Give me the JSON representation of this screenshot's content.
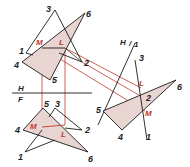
{
  "diagram": {
    "type": "descriptive-geometry-intersection",
    "colors": {
      "line": "#1a1a1a",
      "construction": "#c0392b",
      "fill": "#e8d5d2",
      "label": "#222222",
      "label_red": "#c0392b"
    },
    "plane_labels": {
      "hf_top": "H",
      "hf_bottom": "F",
      "h1_left": "H",
      "h1_right": "1"
    },
    "top_view": {
      "triangle_a": {
        "v1": "1",
        "v2": "2",
        "v3": "3"
      },
      "triangle_b": {
        "v4": "4",
        "v5": "5",
        "v6": "6"
      },
      "points": {
        "m": "M",
        "l": "L"
      }
    },
    "front_view": {
      "triangle_a": {
        "v1": "1",
        "v2": "2",
        "v3": "3"
      },
      "triangle_b": {
        "v4": "4",
        "v5": "5",
        "v6": "6"
      },
      "points": {
        "m": "M",
        "l": "L"
      }
    },
    "aux_view": {
      "edge_labels": {
        "top": "3",
        "bottom": "1"
      },
      "triangle_b": {
        "v4": "4",
        "v5": "5",
        "v6": "6"
      },
      "points": {
        "l": "L",
        "two": "2",
        "m": "M"
      }
    }
  }
}
